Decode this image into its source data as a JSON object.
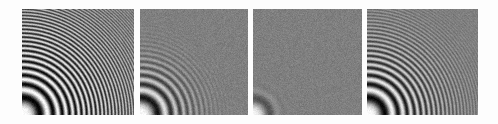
{
  "figure": {
    "width": 498,
    "height": 124,
    "background_color": "#fdfdfd",
    "panel_background_color": "#6b6b6b",
    "ring_dark_color": "#000000",
    "ring_light_color": "#ffffff",
    "panel_count": 4
  },
  "chart_data": {
    "type": "heatmap",
    "xlabel": "",
    "ylabel": "",
    "colormap": "grayscale",
    "value_range": [
      0,
      1
    ],
    "origin": "bottom-left",
    "panels": [
      {
        "index": 1,
        "label": "",
        "x": 22,
        "y": 9,
        "width": 112,
        "height": 106,
        "chirp_k": 0.0098,
        "visible_rings": 13,
        "cutoff_radius_px": 150,
        "blur_sigma_px": 0.55,
        "noise_sigma": 0.055,
        "contrast": 1.0,
        "note": "Reference / original: rings resolved out to near the far corner, faint aliasing fade at top-right"
      },
      {
        "index": 2,
        "label": "",
        "x": 140,
        "y": 9,
        "width": 108,
        "height": 106,
        "chirp_k": 0.0098,
        "visible_rings": 9,
        "cutoff_radius_px": 112,
        "blur_sigma_px": 1.5,
        "noise_sigma": 0.05,
        "contrast": 0.95,
        "note": "Moderately low-pass filtered: outer rings attenuated to flat gray beyond mid radius"
      },
      {
        "index": 3,
        "label": "",
        "x": 253,
        "y": 9,
        "width": 109,
        "height": 106,
        "chirp_k": 0.0098,
        "visible_rings": 3,
        "cutoff_radius_px": 52,
        "blur_sigma_px": 4.2,
        "noise_sigma": 0.05,
        "contrast": 0.92,
        "note": "Heavily low-pass filtered: only the two or three innermost rings survive"
      },
      {
        "index": 4,
        "label": "",
        "x": 367,
        "y": 9,
        "width": 111,
        "height": 106,
        "chirp_k": 0.0098,
        "visible_rings": 12,
        "cutoff_radius_px": 140,
        "blur_sigma_px": 0.9,
        "noise_sigma": 0.045,
        "contrast": 0.98,
        "note": "Restored / reconstructed: ring detail recovered close to the reference, slightly softer"
      }
    ]
  }
}
